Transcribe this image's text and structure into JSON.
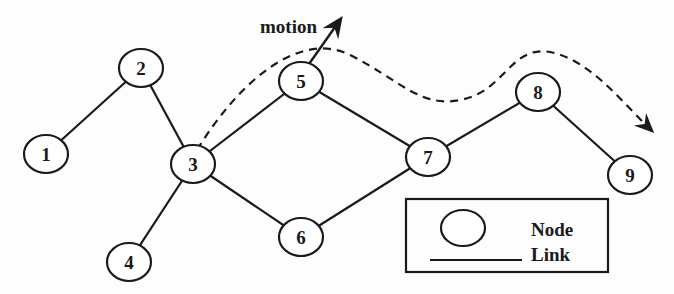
{
  "diagram": {
    "type": "network-graph",
    "nodes": [
      {
        "id": "1",
        "label": "1",
        "x": 46,
        "y": 154
      },
      {
        "id": "2",
        "label": "2",
        "x": 141,
        "y": 68
      },
      {
        "id": "3",
        "label": "3",
        "x": 193,
        "y": 164
      },
      {
        "id": "4",
        "label": "4",
        "x": 129,
        "y": 262
      },
      {
        "id": "5",
        "label": "5",
        "x": 301,
        "y": 81
      },
      {
        "id": "6",
        "label": "6",
        "x": 301,
        "y": 237
      },
      {
        "id": "7",
        "label": "7",
        "x": 428,
        "y": 157
      },
      {
        "id": "8",
        "label": "8",
        "x": 538,
        "y": 92
      },
      {
        "id": "9",
        "label": "9",
        "x": 630,
        "y": 175
      }
    ],
    "links": [
      [
        "1",
        "2"
      ],
      [
        "2",
        "3"
      ],
      [
        "3",
        "5"
      ],
      [
        "3",
        "4"
      ],
      [
        "3",
        "6"
      ],
      [
        "5",
        "7"
      ],
      [
        "6",
        "7"
      ],
      [
        "7",
        "8"
      ],
      [
        "8",
        "9"
      ]
    ],
    "motion": {
      "label": "motion",
      "arrow_from_node": "5"
    },
    "legend": {
      "node_label": "Node",
      "link_label": "Link"
    },
    "colors": {
      "stroke": "#1a1a1a",
      "background": "#fdfdfd"
    }
  }
}
